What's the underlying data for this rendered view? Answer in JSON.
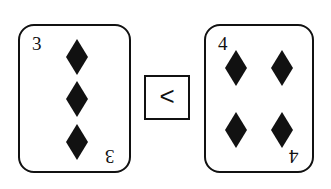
{
  "left_card": {
    "rank": "3",
    "suit": "diamond-icon",
    "pips": 3
  },
  "comparison": {
    "symbol": "<"
  },
  "right_card": {
    "rank": "4",
    "suit": "diamond-icon",
    "pips": 4
  },
  "colors": {
    "ink": "#111111",
    "background": "#ffffff"
  }
}
